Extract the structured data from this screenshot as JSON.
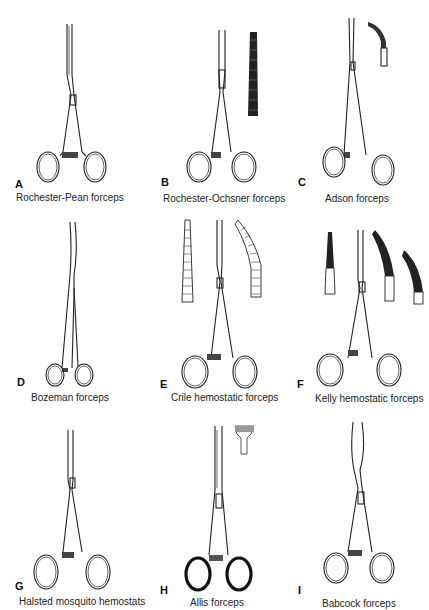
{
  "figure": {
    "panels": [
      {
        "letter": "A",
        "caption": "Rochester-Pean forceps",
        "jaw": "straight",
        "detail": "none"
      },
      {
        "letter": "B",
        "caption": "Rochester-Ochsner forceps",
        "jaw": "straight",
        "detail": "serrated-tip-straight"
      },
      {
        "letter": "C",
        "caption": "Adson forceps",
        "jaw": "long-slender",
        "detail": "curved-tip"
      },
      {
        "letter": "D",
        "caption": "Bozeman forceps",
        "jaw": "s-curved-long",
        "detail": "none"
      },
      {
        "letter": "E",
        "caption": "Crile hemostatic forceps",
        "jaw": "straight",
        "detail": "straight-and-curved-serrated-tips"
      },
      {
        "letter": "F",
        "caption": "Kelly hemostatic forceps",
        "jaw": "straight",
        "detail": "three-partial-serrated-tips"
      },
      {
        "letter": "G",
        "caption": "Halsted mosquito hemostats",
        "jaw": "straight-fine",
        "detail": "none"
      },
      {
        "letter": "H",
        "caption": "Allis forceps",
        "jaw": "straight",
        "detail": "toothed-tip"
      },
      {
        "letter": "I",
        "caption": "Babcock forceps",
        "jaw": "straight-fenestrated",
        "detail": "none"
      }
    ]
  }
}
